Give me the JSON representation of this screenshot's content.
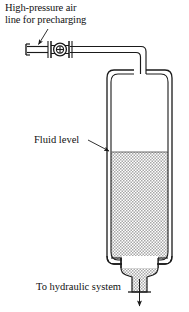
{
  "figure": {
    "background_color": "#ffffff",
    "line_color": "#1a1a1a",
    "fluid_fill_color": "#d9d9d9"
  },
  "labels": {
    "precharge_line_1": "High-pressure air",
    "precharge_line_2": "line for precharging",
    "fluid_level": "Fluid level",
    "outlet": "To hydraulic system"
  },
  "components": {
    "valve": {
      "name": "precharge-valve",
      "symbol": "circle-with-cross"
    },
    "inlet_pipe": {
      "name": "high-pressure-air-pipe",
      "orientation": "horizontal-then-vertical"
    },
    "vessel": {
      "name": "accumulator-shell",
      "wall_style": "double-line"
    },
    "fluid": {
      "name": "fluid-region",
      "pattern": "stipple"
    },
    "outlet_pipe": {
      "name": "hydraulic-outlet",
      "flow_direction": "down"
    }
  },
  "leaders": {
    "precharge_arrow": "arrow-to-inlet-pipe",
    "fluid_level_arrow": "arrow-to-fluid-surface",
    "outlet_arrow": "arrow-down"
  }
}
